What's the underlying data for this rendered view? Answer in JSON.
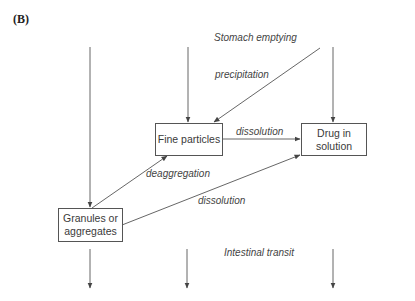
{
  "panel_label": "(B)",
  "nodes": {
    "fine_particles": "Fine particles",
    "drug_in_solution_line1": "Drug in",
    "drug_in_solution_line2": "solution",
    "granules_line1": "Granules or",
    "granules_line2": "aggregates"
  },
  "edge_labels": {
    "stomach_emptying": "Stomach emptying",
    "precipitation": "precipitation",
    "dissolution_fine": "dissolution",
    "deaggregation": "deaggregation",
    "dissolution_granules": "dissolution",
    "intestinal_transit": "Intestinal transit"
  },
  "colors": {
    "line": "#555555",
    "text": "#3a3a3a"
  }
}
